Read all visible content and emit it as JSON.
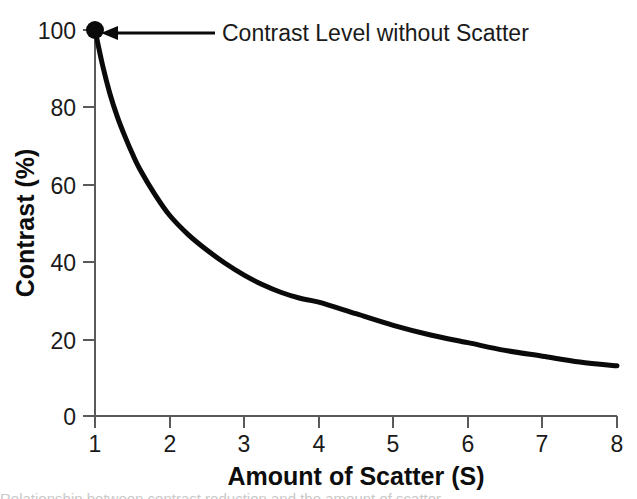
{
  "figure": {
    "background_color": "#ffffff",
    "curve_color": "#0a0a0a",
    "axis_color": "#5a5a5a",
    "text_color": "#1a1a1a"
  },
  "annotation": {
    "label": "Contrast Level without Scatter",
    "marker_point": {
      "x": 1,
      "y": 100
    },
    "arrow_icon": "left-arrow-icon"
  },
  "caption": {
    "clipped_line": "Relationship between contrast reduction and the amount of scatter"
  },
  "chart_data": {
    "type": "line",
    "title": "",
    "subtitle": "",
    "xlabel": "Amount of Scatter (S)",
    "ylabel": "Contrast (%)",
    "xlim": [
      1,
      8
    ],
    "ylim": [
      0,
      100
    ],
    "xticks": [
      1,
      2,
      3,
      4,
      5,
      6,
      7,
      8
    ],
    "xtick_labels": [
      "1",
      "2",
      "3",
      "4",
      "5",
      "6",
      "7",
      "8"
    ],
    "yticks": [
      0,
      20,
      40,
      60,
      80,
      100
    ],
    "ytick_labels": [
      "0",
      "20",
      "40",
      "60",
      "80",
      "100"
    ],
    "grid": false,
    "legend": null,
    "legend_position": "none",
    "series": [
      {
        "name": "Contrast",
        "x": [
          1.0,
          1.1,
          1.2,
          1.3,
          1.4,
          1.5,
          1.6,
          1.8,
          2.0,
          2.25,
          2.5,
          2.75,
          3.0,
          3.25,
          3.5,
          3.75,
          4.0,
          4.5,
          5.0,
          5.5,
          6.0,
          6.5,
          7.0,
          7.5,
          8.0
        ],
        "values": [
          100.0,
          91.0,
          83.5,
          77.5,
          72.5,
          68.0,
          64.0,
          57.5,
          52.0,
          47.0,
          43.0,
          39.5,
          36.5,
          34.0,
          32.0,
          30.5,
          29.5,
          26.5,
          23.5,
          21.0,
          19.0,
          17.0,
          15.5,
          14.0,
          13.0
        ]
      }
    ],
    "annotations": [
      {
        "text": "Contrast Level without Scatter",
        "points_to": {
          "x": 1,
          "y": 100
        },
        "marker": "filled-circle"
      }
    ]
  }
}
